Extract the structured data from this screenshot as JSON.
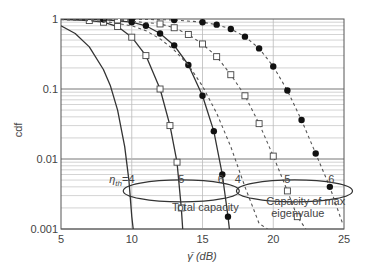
{
  "chart_data": {
    "type": "line",
    "title": "",
    "xlabel": "γ̄ (dB)",
    "ylabel": "cdf",
    "xlim": [
      5,
      25
    ],
    "ylim": [
      0.001,
      1
    ],
    "yscale": "log",
    "grid": true,
    "x_ticks": [
      "5",
      "10",
      "15",
      "20",
      "25"
    ],
    "y_ticks": [
      "1",
      "0.1",
      "0.01",
      "0.001"
    ],
    "annotations": [
      {
        "text": "η_th = 4",
        "x": 9.3,
        "y": 0.0045
      },
      {
        "text": "5",
        "x": 13.5,
        "y": 0.0045
      },
      {
        "text": "6",
        "x": 16.3,
        "y": 0.0045
      },
      {
        "text": "4",
        "x": 17.5,
        "y": 0.0045
      },
      {
        "text": "5",
        "x": 21.0,
        "y": 0.0045
      },
      {
        "text": "6",
        "x": 24.1,
        "y": 0.0045
      },
      {
        "text": "Total capacity",
        "x": 15.2,
        "y": 0.0018
      },
      {
        "text": "Capacity of max eigenvalue",
        "x": 22.3,
        "y": 0.0018
      }
    ],
    "groups": [
      {
        "name": "Total capacity",
        "ellipse_center": [
          13.5,
          0.0035
        ]
      },
      {
        "name": "Capacity of max eigenvalue",
        "ellipse_center": [
          21.5,
          0.0035
        ]
      }
    ],
    "series": [
      {
        "name": "Total capacity, η_th=4",
        "style": "solid",
        "marker": "none",
        "x": [
          5,
          6,
          7,
          8,
          8.5,
          9,
          9.5,
          9.8,
          10.0,
          10.1
        ],
        "y": [
          0.8,
          0.62,
          0.4,
          0.19,
          0.11,
          0.05,
          0.015,
          0.005,
          0.0015,
          0.001
        ]
      },
      {
        "name": "Total capacity, η_th=5",
        "style": "solid",
        "marker": "square",
        "x": [
          5,
          7,
          8,
          9,
          10,
          11,
          12,
          12.7,
          13.2,
          13.5,
          13.6
        ],
        "y": [
          0.99,
          0.95,
          0.9,
          0.78,
          0.55,
          0.3,
          0.1,
          0.03,
          0.009,
          0.002,
          0.001
        ]
      },
      {
        "name": "Total capacity, η_th=6",
        "style": "solid",
        "marker": "circle-filled",
        "x": [
          5,
          8,
          10,
          11,
          12,
          13,
          14,
          15,
          15.8,
          16.4,
          16.8,
          16.9
        ],
        "y": [
          1.0,
          0.98,
          0.9,
          0.8,
          0.62,
          0.42,
          0.22,
          0.08,
          0.025,
          0.006,
          0.0015,
          0.001
        ]
      },
      {
        "name": "Max eigenvalue capacity, η_th=4",
        "style": "dashed",
        "marker": "none",
        "x": [
          5,
          8,
          10,
          11,
          12,
          13,
          14,
          15,
          16,
          17,
          18,
          19,
          19.6
        ],
        "y": [
          0.98,
          0.93,
          0.8,
          0.68,
          0.52,
          0.36,
          0.22,
          0.11,
          0.045,
          0.015,
          0.004,
          0.0012,
          0.001
        ]
      },
      {
        "name": "Max eigenvalue capacity, η_th=5",
        "style": "dashed",
        "marker": "square",
        "x": [
          5,
          9,
          12,
          13,
          14,
          15,
          16,
          17,
          18,
          19,
          20,
          21,
          21.7,
          22.3
        ],
        "y": [
          1.0,
          0.97,
          0.85,
          0.75,
          0.6,
          0.44,
          0.29,
          0.16,
          0.08,
          0.032,
          0.011,
          0.0035,
          0.0015,
          0.001
        ]
      },
      {
        "name": "Max eigenvalue capacity, η_th=6",
        "style": "dashed",
        "marker": "circle-filled",
        "x": [
          5,
          10,
          13,
          15,
          16,
          17,
          18,
          19,
          20,
          21,
          22,
          23,
          24,
          24.9
        ],
        "y": [
          1.0,
          0.99,
          0.97,
          0.9,
          0.83,
          0.72,
          0.56,
          0.38,
          0.21,
          0.095,
          0.036,
          0.012,
          0.004,
          0.0012
        ]
      }
    ]
  }
}
